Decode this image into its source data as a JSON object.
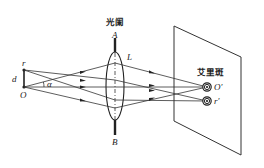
{
  "diagram": {
    "title_aperture": "光阑",
    "label_A": "A",
    "label_B": "B",
    "label_L": "L",
    "label_r": "r",
    "label_d": "d",
    "label_O": "O",
    "label_alpha": "α",
    "label_airy": "艾里斑",
    "label_O_prime": "O′",
    "label_r_prime": "r′",
    "colors": {
      "line": "#333333",
      "background": "#ffffff"
    }
  }
}
